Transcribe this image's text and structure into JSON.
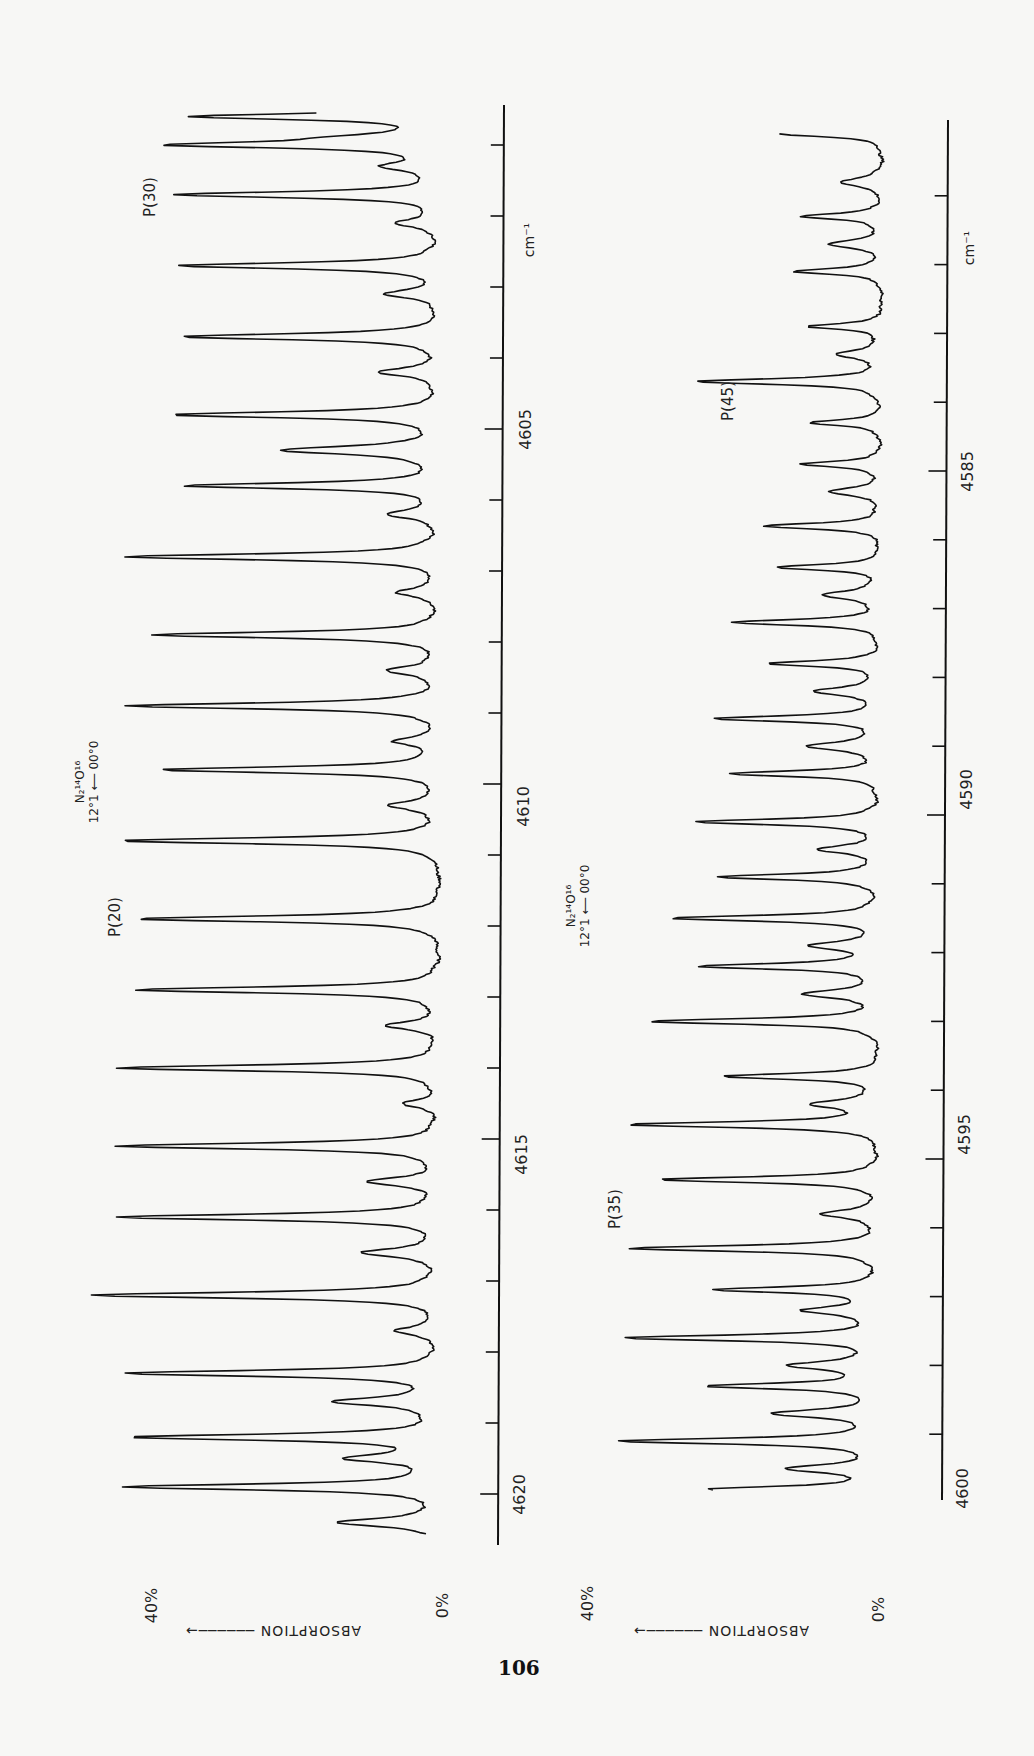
{
  "page": {
    "number": "106"
  },
  "panels": [
    {
      "id": "top",
      "molecule": {
        "formula": "N₂¹⁴O¹⁶",
        "transition": "12°1 ⟵ 00°0"
      },
      "axis": {
        "unit": "cm⁻¹",
        "ticks_major": [
          4605,
          4610,
          4615,
          4620
        ],
        "range": [
          4600.4,
          4621.0
        ]
      },
      "y_axis": {
        "label": "ABSORPTION",
        "min_label": "0%",
        "max_label": "40%"
      },
      "annotations": [
        {
          "text": "P(30)",
          "at": 4601.0
        },
        {
          "text": "P(20)",
          "at": 4612.0
        }
      ]
    },
    {
      "id": "bottom",
      "molecule": {
        "formula": "N₂¹⁴O¹⁶",
        "transition": "12°1 ⟵ 00°0"
      },
      "axis": {
        "unit": "cm⁻¹",
        "ticks_major": [
          4585,
          4590,
          4595,
          4600
        ],
        "range": [
          4580.1,
          4600.2
        ]
      },
      "y_axis": {
        "label": "ABSORPTION",
        "min_label": "0%",
        "max_label": "40%"
      },
      "annotations": [
        {
          "text": "P(45)",
          "at": 4583.7
        },
        {
          "text": "P(35)",
          "at": 4596.3
        }
      ]
    }
  ],
  "chart_data": [
    {
      "type": "line",
      "title": "N₂¹⁴O¹⁶ 12°1 ← 00°0 absorption spectrum (P-branch)",
      "xlabel": "cm⁻¹",
      "ylabel": "ABSORPTION",
      "xlim": [
        4600.4,
        4621.0
      ],
      "ylim": [
        0,
        40
      ],
      "y_tick_labels": [
        "0%",
        "40%"
      ],
      "x_tick_labels": [
        "4605",
        "4610",
        "4615",
        "4620"
      ],
      "grid": false,
      "orientation": "rotated 90° (wavenumber axis vertical, absorption increasing leftward)",
      "annotations": [
        "P(30)",
        "P(20)"
      ],
      "peaks": [
        {
          "x": 4600.6,
          "y": 28
        },
        {
          "x": 4601.0,
          "y": 29
        },
        {
          "x": 4601.7,
          "y": 30
        },
        {
          "x": 4602.7,
          "y": 30
        },
        {
          "x": 4603.7,
          "y": 30
        },
        {
          "x": 4604.8,
          "y": 31
        },
        {
          "x": 4605.8,
          "y": 29
        },
        {
          "x": 4606.8,
          "y": 36
        },
        {
          "x": 4607.9,
          "y": 33
        },
        {
          "x": 4608.9,
          "y": 36
        },
        {
          "x": 4609.8,
          "y": 32
        },
        {
          "x": 4610.8,
          "y": 37
        },
        {
          "x": 4611.9,
          "y": 35
        },
        {
          "x": 4612.9,
          "y": 35
        },
        {
          "x": 4614.0,
          "y": 37
        },
        {
          "x": 4615.1,
          "y": 37
        },
        {
          "x": 4616.1,
          "y": 37
        },
        {
          "x": 4617.2,
          "y": 40
        },
        {
          "x": 4618.3,
          "y": 36
        },
        {
          "x": 4619.2,
          "y": 35
        },
        {
          "x": 4619.9,
          "y": 36
        }
      ],
      "minor_peaks": [
        {
          "x": 4600.9,
          "y": 8
        },
        {
          "x": 4601.3,
          "y": 6
        },
        {
          "x": 4602.1,
          "y": 5
        },
        {
          "x": 4603.1,
          "y": 6
        },
        {
          "x": 4604.2,
          "y": 7
        },
        {
          "x": 4605.3,
          "y": 18
        },
        {
          "x": 4606.2,
          "y": 6
        },
        {
          "x": 4607.3,
          "y": 5
        },
        {
          "x": 4608.4,
          "y": 6
        },
        {
          "x": 4609.4,
          "y": 5
        },
        {
          "x": 4610.3,
          "y": 6
        },
        {
          "x": 4613.4,
          "y": 6
        },
        {
          "x": 4614.5,
          "y": 4
        },
        {
          "x": 4615.6,
          "y": 8
        },
        {
          "x": 4616.6,
          "y": 9
        },
        {
          "x": 4617.7,
          "y": 5
        },
        {
          "x": 4618.7,
          "y": 12
        },
        {
          "x": 4619.5,
          "y": 10
        },
        {
          "x": 4620.4,
          "y": 12
        }
      ]
    },
    {
      "type": "line",
      "title": "N₂¹⁴O¹⁶ 12°1 ← 00°0 absorption spectrum (P-branch)",
      "xlabel": "cm⁻¹",
      "ylabel": "ABSORPTION",
      "xlim": [
        4580.1,
        4600.2
      ],
      "ylim": [
        0,
        40
      ],
      "y_tick_labels": [
        "0%",
        "40%"
      ],
      "x_tick_labels": [
        "4585",
        "4590",
        "4595",
        "4600"
      ],
      "grid": false,
      "orientation": "rotated 90° (wavenumber axis vertical, absorption increasing leftward)",
      "annotations": [
        "P(45)",
        "P(35)"
      ],
      "peaks": [
        {
          "x": 4580.1,
          "y": 14
        },
        {
          "x": 4581.3,
          "y": 11
        },
        {
          "x": 4582.1,
          "y": 12
        },
        {
          "x": 4582.9,
          "y": 10
        },
        {
          "x": 4583.7,
          "y": 25
        },
        {
          "x": 4584.3,
          "y": 10
        },
        {
          "x": 4584.9,
          "y": 11
        },
        {
          "x": 4585.8,
          "y": 16
        },
        {
          "x": 4586.4,
          "y": 14
        },
        {
          "x": 4587.2,
          "y": 20
        },
        {
          "x": 4587.8,
          "y": 15
        },
        {
          "x": 4588.6,
          "y": 22
        },
        {
          "x": 4589.4,
          "y": 20
        },
        {
          "x": 4590.1,
          "y": 25
        },
        {
          "x": 4590.9,
          "y": 22
        },
        {
          "x": 4591.5,
          "y": 28
        },
        {
          "x": 4592.2,
          "y": 24
        },
        {
          "x": 4593.0,
          "y": 31
        },
        {
          "x": 4593.8,
          "y": 21
        },
        {
          "x": 4594.5,
          "y": 34
        },
        {
          "x": 4595.3,
          "y": 30
        },
        {
          "x": 4596.3,
          "y": 34
        },
        {
          "x": 4596.9,
          "y": 22
        },
        {
          "x": 4597.6,
          "y": 34
        },
        {
          "x": 4598.3,
          "y": 23
        },
        {
          "x": 4599.1,
          "y": 35
        },
        {
          "x": 4599.8,
          "y": 23
        }
      ],
      "minor_peaks": [
        {
          "x": 4580.8,
          "y": 6
        },
        {
          "x": 4581.7,
          "y": 7
        },
        {
          "x": 4583.3,
          "y": 6
        },
        {
          "x": 4585.3,
          "y": 7
        },
        {
          "x": 4586.8,
          "y": 8
        },
        {
          "x": 4588.2,
          "y": 9
        },
        {
          "x": 4589.0,
          "y": 10
        },
        {
          "x": 4590.5,
          "y": 8
        },
        {
          "x": 4591.9,
          "y": 9
        },
        {
          "x": 4592.6,
          "y": 10
        },
        {
          "x": 4594.2,
          "y": 9
        },
        {
          "x": 4595.8,
          "y": 8
        },
        {
          "x": 4597.2,
          "y": 10
        },
        {
          "x": 4598.0,
          "y": 12
        },
        {
          "x": 4598.7,
          "y": 14
        },
        {
          "x": 4599.5,
          "y": 12
        }
      ]
    }
  ]
}
